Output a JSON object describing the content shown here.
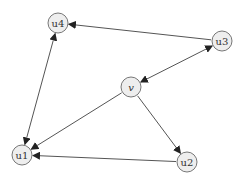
{
  "diagram": {
    "type": "directed-graph",
    "node_radius": 10,
    "colors": {
      "node_fill": "#eeeeee",
      "node_stroke": "#777777",
      "edge": "#555555",
      "label": "#333333"
    },
    "nodes": [
      {
        "id": "u4",
        "label": "u4",
        "x": 58,
        "y": 23,
        "italic": false
      },
      {
        "id": "u3",
        "label": "u3",
        "x": 222,
        "y": 41,
        "italic": false
      },
      {
        "id": "v",
        "label": "v",
        "x": 131,
        "y": 87,
        "italic": true
      },
      {
        "id": "u1",
        "label": "u1",
        "x": 22,
        "y": 155,
        "italic": false
      },
      {
        "id": "u2",
        "label": "u2",
        "x": 187,
        "y": 162,
        "italic": false
      }
    ],
    "edges": [
      {
        "from": "u3",
        "to": "u4",
        "bidirectional": false
      },
      {
        "from": "u4",
        "to": "u1",
        "bidirectional": true
      },
      {
        "from": "v",
        "to": "u3",
        "bidirectional": true
      },
      {
        "from": "v",
        "to": "u1",
        "bidirectional": false
      },
      {
        "from": "v",
        "to": "u2",
        "bidirectional": false
      },
      {
        "from": "u2",
        "to": "u1",
        "bidirectional": false
      }
    ]
  }
}
